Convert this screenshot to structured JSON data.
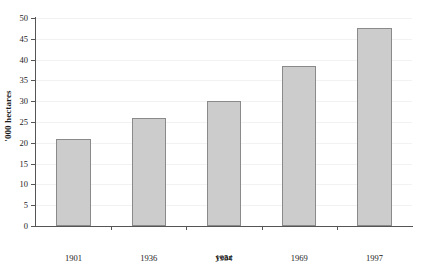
{
  "chart_data": {
    "type": "bar",
    "title": "",
    "xlabel": "year",
    "ylabel": "'000 hectares",
    "categories": [
      "1901",
      "1936",
      "1954",
      "1969",
      "1997"
    ],
    "values": [
      21,
      26,
      30,
      38.5,
      47.5
    ],
    "ylim": [
      0,
      50
    ],
    "yticks": [
      0,
      5,
      10,
      15,
      20,
      25,
      30,
      35,
      40,
      45,
      50
    ],
    "ytick_labels": [
      "0",
      "5",
      "10",
      "15",
      "20",
      "25",
      "30",
      "35",
      "40",
      "45",
      "50"
    ],
    "grid": true,
    "legend": false,
    "bar_fill_color": "#cccccc",
    "bar_border_color": "#8a8a8a",
    "axis_color": "#555555",
    "gridline_color": "#f2f2f2"
  }
}
